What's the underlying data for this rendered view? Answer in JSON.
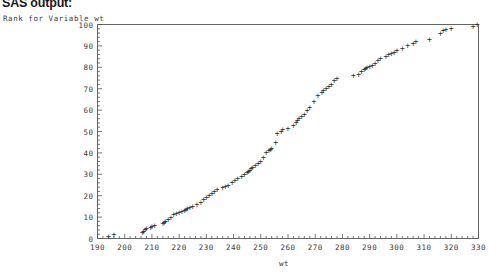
{
  "document": {
    "heading": "SAS output:"
  },
  "chart_data": {
    "type": "scatter",
    "title": "",
    "ylabel": "Rank for Variable wt",
    "xlabel": "wt",
    "xlim": [
      190,
      330
    ],
    "ylim": [
      0,
      100
    ],
    "grid": false,
    "legend": false,
    "marker": "plus",
    "marker_color": "#2b2b2b",
    "frame_color": "#555555",
    "xticks": [
      190,
      200,
      210,
      220,
      230,
      240,
      250,
      260,
      270,
      280,
      290,
      300,
      310,
      320,
      330
    ],
    "yticks": [
      0,
      10,
      20,
      30,
      40,
      50,
      60,
      70,
      80,
      90,
      100
    ],
    "xtick_labels": [
      "190",
      "200",
      "210",
      "220",
      "230",
      "240",
      "250",
      "260",
      "270",
      "280",
      "290",
      "300",
      "310",
      "320",
      "330"
    ],
    "ytick_labels": [
      "0",
      "10",
      "20",
      "30",
      "40",
      "50",
      "60",
      "70",
      "80",
      "90",
      "100"
    ],
    "x_minor_tick_interval": 2,
    "y_minor_tick_interval": 2,
    "series": [
      {
        "name": "Rank for Variable wt",
        "x": [
          194,
          196,
          206.5,
          207,
          207.5,
          208,
          209.5,
          210,
          211,
          214,
          214.5,
          215,
          216,
          217,
          218,
          219,
          220,
          221,
          222,
          222.5,
          223,
          224,
          225,
          226.5,
          228,
          229,
          230,
          231,
          232,
          233,
          234,
          236,
          237,
          238,
          239.5,
          240.5,
          241.5,
          243,
          244,
          245,
          245.5,
          246,
          246.5,
          247,
          248,
          249,
          250,
          251,
          252,
          253,
          253.5,
          254,
          255.5,
          256,
          257.5,
          258,
          260,
          262,
          263,
          263.5,
          264,
          265,
          266,
          267,
          268,
          269.5,
          271,
          272.5,
          273,
          274,
          275,
          276,
          277,
          278,
          284,
          286,
          287,
          288,
          288.5,
          289,
          290,
          291,
          292,
          293,
          294,
          296,
          297,
          298,
          299,
          300,
          302,
          304,
          306,
          307,
          312,
          316,
          317,
          318,
          320,
          328,
          329.5
        ],
        "y": [
          1,
          2,
          3,
          3.5,
          4,
          4.5,
          5,
          5.5,
          6,
          7,
          7.5,
          8,
          9,
          10,
          11,
          11.5,
          12,
          12.5,
          13,
          13.5,
          14,
          14.5,
          15,
          16,
          17,
          18,
          19,
          20,
          21,
          22,
          23,
          24,
          24.5,
          25,
          26,
          27,
          28,
          29,
          30,
          31,
          31.5,
          32,
          32.5,
          33,
          34,
          35,
          36,
          38,
          40,
          41,
          41.5,
          42,
          45,
          49,
          50,
          51,
          51.5,
          53,
          54,
          55,
          56,
          57,
          58,
          60,
          61,
          64,
          67,
          68,
          69,
          70,
          71,
          72,
          74,
          75,
          76,
          76.5,
          78,
          79,
          79.5,
          80,
          80.5,
          81,
          82,
          83,
          84,
          85,
          86,
          86.5,
          87,
          88,
          89,
          90,
          91,
          92,
          93,
          96,
          97,
          97.5,
          98,
          99,
          100
        ]
      }
    ]
  }
}
